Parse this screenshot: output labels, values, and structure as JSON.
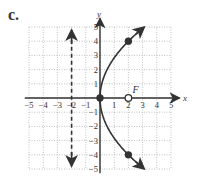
{
  "label": "c.",
  "chart_data": {
    "type": "line",
    "title": "",
    "xlabel": "x",
    "ylabel": "y",
    "xlim": [
      -5,
      5
    ],
    "ylim": [
      -5,
      5
    ],
    "grid": true,
    "x_ticks": [
      "-5",
      "-4",
      "-3",
      "-2",
      "-1",
      "1",
      "2",
      "3",
      "4",
      "5"
    ],
    "y_ticks": [
      "5",
      "4",
      "3",
      "2",
      "1",
      "-1",
      "-2",
      "-3",
      "-4",
      "-5"
    ],
    "series": [
      {
        "name": "parabola",
        "equation": "x = y^2/8",
        "points": [
          [
            3.125,
            5
          ],
          [
            2,
            4
          ],
          [
            0,
            0
          ],
          [
            2,
            -4
          ],
          [
            3.125,
            -5
          ]
        ],
        "arrows": true
      },
      {
        "name": "directrix",
        "equation": "x = -2",
        "style": "dashed",
        "arrows": true
      }
    ],
    "points": [
      {
        "x": 0,
        "y": 0,
        "filled": true,
        "label": ""
      },
      {
        "x": 2,
        "y": 4,
        "filled": true,
        "label": ""
      },
      {
        "x": 2,
        "y": -4,
        "filled": true,
        "label": ""
      },
      {
        "x": 2,
        "y": 0,
        "filled": false,
        "label": "F"
      }
    ]
  }
}
